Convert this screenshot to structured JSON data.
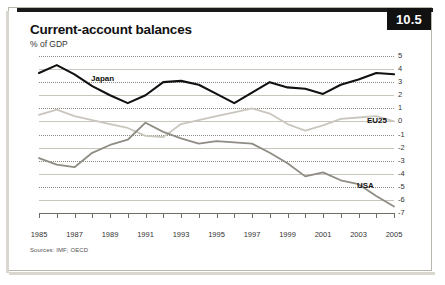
{
  "badge": {
    "number": "10.5"
  },
  "header": {
    "title": "Current-account balances",
    "subtitle": "% of GDP"
  },
  "footer": {
    "source": "Sources: IMF; OECD"
  },
  "labels": {
    "japan": "Japan",
    "eu25": "EU25",
    "usa": "USA"
  },
  "chart_data": {
    "type": "line",
    "title": "Current-account balances",
    "subtitle": "% of GDP",
    "xlabel": "",
    "ylabel": "% of GDP",
    "ylim": [
      -7,
      5
    ],
    "yticks": [
      5,
      4,
      3,
      2,
      1,
      0,
      -1,
      -2,
      -3,
      -4,
      -5,
      -6,
      -7
    ],
    "xlim": [
      1985,
      2005
    ],
    "xticks": [
      1985,
      1987,
      1989,
      1991,
      1993,
      1995,
      1997,
      1999,
      2001,
      2003,
      2005
    ],
    "x": [
      1985,
      1986,
      1987,
      1988,
      1989,
      1990,
      1991,
      1992,
      1993,
      1994,
      1995,
      1996,
      1997,
      1998,
      1999,
      2000,
      2001,
      2002,
      2003,
      2004,
      2005
    ],
    "grid": true,
    "legend_position": "inline-labels",
    "series": [
      {
        "name": "Japan",
        "color": "#111111",
        "values": [
          3.7,
          4.3,
          3.6,
          2.7,
          2.0,
          1.4,
          2.0,
          3.0,
          3.1,
          2.8,
          2.1,
          1.4,
          2.2,
          3.0,
          2.6,
          2.5,
          2.1,
          2.8,
          3.2,
          3.7,
          3.6
        ]
      },
      {
        "name": "EU25",
        "color": "#c9c6bd",
        "values": [
          0.5,
          0.9,
          0.4,
          0.1,
          -0.2,
          -0.5,
          -1.1,
          -1.2,
          -0.2,
          0.1,
          0.4,
          0.7,
          1.0,
          0.6,
          -0.2,
          -0.7,
          -0.3,
          0.2,
          0.3,
          0.4,
          0.0
        ]
      },
      {
        "name": "USA",
        "color": "#8f8c84",
        "values": [
          -2.8,
          -3.3,
          -3.5,
          -2.4,
          -1.8,
          -1.4,
          -0.1,
          -0.8,
          -1.3,
          -1.7,
          -1.5,
          -1.6,
          -1.7,
          -2.4,
          -3.2,
          -4.2,
          -3.9,
          -4.5,
          -4.8,
          -5.7,
          -6.5
        ]
      }
    ]
  }
}
